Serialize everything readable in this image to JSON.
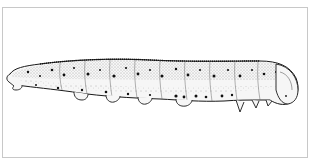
{
  "figure": {
    "style": "stippled pen-and-ink illustration",
    "orientation": "head facing right",
    "colors": {
      "ink": "#1a1a1a",
      "body_fill": "#f4f4f4",
      "frame_border": "#c8c8c8",
      "background": "#ffffff"
    }
  }
}
